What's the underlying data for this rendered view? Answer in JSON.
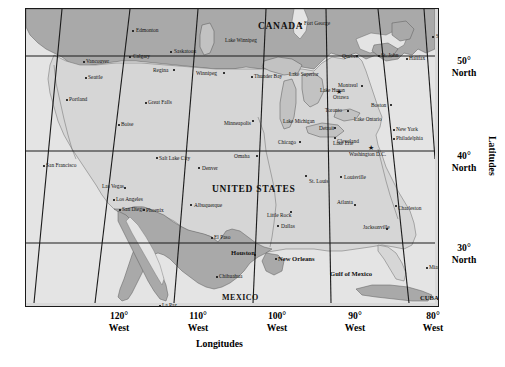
{
  "figure": {
    "type": "map",
    "projection_note": "conic projection of North America with curved meridians",
    "axes": {
      "longitude_title": "Longitudes",
      "latitude_title": "Latitudes",
      "longitude_ticks": [
        {
          "value": "120°",
          "hemisphere": "West",
          "x": 94
        },
        {
          "value": "110°",
          "hemisphere": "West",
          "x": 173
        },
        {
          "value": "100°",
          "hemisphere": "West",
          "x": 252
        },
        {
          "value": "90°",
          "hemisphere": "West",
          "x": 330
        },
        {
          "value": "80°",
          "hemisphere": "West",
          "x": 408
        }
      ],
      "latitude_ticks": [
        {
          "value": "50°",
          "hemisphere": "North",
          "y": 47
        },
        {
          "value": "40°",
          "hemisphere": "North",
          "y": 142
        },
        {
          "value": "30°",
          "hemisphere": "North",
          "y": 234
        }
      ]
    },
    "colors": {
      "land_usa": "#d9d9d9",
      "land_canada_mexico": "#a8a8a8",
      "water": "#e8e8e8",
      "frame": "#1a1a1a",
      "graticule": "#1a1a1a",
      "text": "#111111"
    },
    "countries": [
      {
        "name": "CANADA",
        "x": 232,
        "y": 13,
        "class": "country"
      },
      {
        "name": "UNITED STATES",
        "x": 186,
        "y": 176,
        "class": "country"
      },
      {
        "name": "MEXICO",
        "x": 196,
        "y": 285,
        "class": "country-sm"
      },
      {
        "name": "CUBA",
        "x": 394,
        "y": 286,
        "class": "city-bold"
      }
    ],
    "water_bodies": [
      {
        "name": "Gulf of Mexico",
        "x": 304,
        "y": 262,
        "class": "water"
      },
      {
        "name": "Lake Winnipeg",
        "x": 199,
        "y": 29,
        "class": "lake"
      },
      {
        "name": "Lake Superior",
        "x": 263,
        "y": 63,
        "class": "lake"
      },
      {
        "name": "Lake Huron",
        "x": 294,
        "y": 79,
        "class": "lake"
      },
      {
        "name": "Lake Michigan",
        "x": 257,
        "y": 110,
        "class": "lake"
      },
      {
        "name": "Lake Ontario",
        "x": 328,
        "y": 108,
        "class": "lake"
      },
      {
        "name": "Lake Erie",
        "x": 307,
        "y": 132,
        "class": "lake"
      }
    ],
    "capitals": [
      {
        "name": "Ottawa",
        "x": 307,
        "y": 86,
        "dot_x": 310,
        "dot_y": 80
      },
      {
        "name": "Washington D.C.",
        "x": 323,
        "y": 143,
        "dot_x": 342,
        "dot_y": 136
      }
    ],
    "cities": [
      {
        "name": "Edmonton",
        "x": 110,
        "y": 19,
        "dot_x": 106,
        "dot_y": 21,
        "anchor": "left"
      },
      {
        "name": "Saskatoon",
        "x": 148,
        "y": 40,
        "dot_x": 144,
        "dot_y": 42,
        "anchor": "left"
      },
      {
        "name": "Calgary",
        "x": 107,
        "y": 45,
        "dot_x": 103,
        "dot_y": 47,
        "anchor": "left"
      },
      {
        "name": "Vancouver",
        "x": 60,
        "y": 50,
        "dot_x": 57,
        "dot_y": 52,
        "anchor": "left"
      },
      {
        "name": "Regina",
        "x": 127,
        "y": 59,
        "dot_x": 147,
        "dot_y": 60,
        "anchor": "left"
      },
      {
        "name": "Winnipeg",
        "x": 170,
        "y": 62,
        "dot_x": 197,
        "dot_y": 63,
        "anchor": "left"
      },
      {
        "name": "Thunder Bay",
        "x": 228,
        "y": 65,
        "dot_x": 225,
        "dot_y": 67,
        "anchor": "left"
      },
      {
        "name": "Fort George",
        "x": 278,
        "y": 12,
        "dot_x": 274,
        "dot_y": 14,
        "anchor": "left"
      },
      {
        "name": "Sydney",
        "x": 410,
        "y": 25,
        "dot_x": 406,
        "dot_y": 27,
        "anchor": "left"
      },
      {
        "name": "Quebec",
        "x": 316,
        "y": 45,
        "dot_x": 330,
        "dot_y": 46,
        "anchor": "left"
      },
      {
        "name": "St. John",
        "x": 355,
        "y": 44,
        "dot_x": 352,
        "dot_y": 46,
        "anchor": "left"
      },
      {
        "name": "Halifax",
        "x": 383,
        "y": 47,
        "dot_x": 380,
        "dot_y": 49,
        "anchor": "left"
      },
      {
        "name": "Seattle",
        "x": 62,
        "y": 66,
        "dot_x": 59,
        "dot_y": 68,
        "anchor": "left"
      },
      {
        "name": "Montreal",
        "x": 312,
        "y": 74,
        "dot_x": 335,
        "dot_y": 76,
        "anchor": "left"
      },
      {
        "name": "Boston",
        "x": 345,
        "y": 94,
        "dot_x": 364,
        "dot_y": 95,
        "anchor": "left"
      },
      {
        "name": "Portland",
        "x": 43,
        "y": 88,
        "dot_x": 40,
        "dot_y": 90,
        "anchor": "left"
      },
      {
        "name": "Great Falls",
        "x": 122,
        "y": 91,
        "dot_x": 119,
        "dot_y": 93,
        "anchor": "left"
      },
      {
        "name": "Minneapolis",
        "x": 198,
        "y": 112,
        "dot_x": 226,
        "dot_y": 111,
        "anchor": "left"
      },
      {
        "name": "Toronto",
        "x": 299,
        "y": 99,
        "dot_x": 321,
        "dot_y": 101,
        "anchor": "left"
      },
      {
        "name": "Boise",
        "x": 95,
        "y": 113,
        "dot_x": 92,
        "dot_y": 115,
        "anchor": "left"
      },
      {
        "name": "Detroit",
        "x": 293,
        "y": 117,
        "dot_x": 308,
        "dot_y": 118,
        "anchor": "left"
      },
      {
        "name": "New York",
        "x": 370,
        "y": 118,
        "dot_x": 367,
        "dot_y": 120,
        "anchor": "left"
      },
      {
        "name": "Chicago",
        "x": 252,
        "y": 131,
        "dot_x": 273,
        "dot_y": 132,
        "anchor": "left"
      },
      {
        "name": "Cleveland",
        "x": 311,
        "y": 130,
        "dot_x": 308,
        "dot_y": 128,
        "anchor": "left"
      },
      {
        "name": "Philadelphia",
        "x": 370,
        "y": 127,
        "dot_x": 367,
        "dot_y": 129,
        "anchor": "left"
      },
      {
        "name": "Salt Lake City",
        "x": 133,
        "y": 147,
        "dot_x": 130,
        "dot_y": 148,
        "anchor": "left"
      },
      {
        "name": "Omaha",
        "x": 208,
        "y": 145,
        "dot_x": 230,
        "dot_y": 146,
        "anchor": "left"
      },
      {
        "name": "San Francisco",
        "x": 20,
        "y": 154,
        "dot_x": 17,
        "dot_y": 156,
        "anchor": "left"
      },
      {
        "name": "Denver",
        "x": 176,
        "y": 157,
        "dot_x": 172,
        "dot_y": 158,
        "anchor": "left"
      },
      {
        "name": "St. Louis",
        "x": 283,
        "y": 170,
        "dot_x": 279,
        "dot_y": 166,
        "anchor": "left"
      },
      {
        "name": "Louisville",
        "x": 318,
        "y": 166,
        "dot_x": 314,
        "dot_y": 167,
        "anchor": "left"
      },
      {
        "name": "Las Vegas",
        "x": 76,
        "y": 175,
        "dot_x": 98,
        "dot_y": 178,
        "anchor": "left"
      },
      {
        "name": "Los Angeles",
        "x": 90,
        "y": 188,
        "dot_x": 87,
        "dot_y": 190,
        "anchor": "left"
      },
      {
        "name": "Albuquerque",
        "x": 168,
        "y": 194,
        "dot_x": 164,
        "dot_y": 195,
        "anchor": "left"
      },
      {
        "name": "Atlanta",
        "x": 311,
        "y": 191,
        "dot_x": 328,
        "dot_y": 195,
        "anchor": "left"
      },
      {
        "name": "Charleston",
        "x": 372,
        "y": 197,
        "dot_x": 369,
        "dot_y": 196,
        "anchor": "left"
      },
      {
        "name": "San Diego",
        "x": 96,
        "y": 198,
        "dot_x": 93,
        "dot_y": 200,
        "anchor": "left"
      },
      {
        "name": "Phoenix",
        "x": 120,
        "y": 199,
        "dot_x": 117,
        "dot_y": 200,
        "anchor": "left"
      },
      {
        "name": "Little Rock",
        "x": 241,
        "y": 204,
        "dot_x": 264,
        "dot_y": 202,
        "anchor": "left"
      },
      {
        "name": "Dallas",
        "x": 255,
        "y": 215,
        "dot_x": 251,
        "dot_y": 216,
        "anchor": "left"
      },
      {
        "name": "Jacksonville",
        "x": 337,
        "y": 216,
        "dot_x": 360,
        "dot_y": 219,
        "anchor": "left"
      },
      {
        "name": "El Paso",
        "x": 188,
        "y": 226,
        "dot_x": 185,
        "dot_y": 228,
        "anchor": "left"
      },
      {
        "name": "Chihuahua",
        "x": 193,
        "y": 265,
        "dot_x": 190,
        "dot_y": 267,
        "anchor": "left"
      },
      {
        "name": "Miami",
        "x": 403,
        "y": 256,
        "dot_x": 400,
        "dot_y": 258,
        "anchor": "left"
      },
      {
        "name": "La Paz",
        "x": 136,
        "y": 294,
        "dot_x": 133,
        "dot_y": 296,
        "anchor": "left"
      }
    ],
    "cities_bold": [
      {
        "name": "Houston",
        "x": 205,
        "y": 241,
        "dot_x": 228,
        "dot_y": 245
      },
      {
        "name": "New Orleans",
        "x": 252,
        "y": 247,
        "dot_x": 249,
        "dot_y": 249
      }
    ]
  }
}
